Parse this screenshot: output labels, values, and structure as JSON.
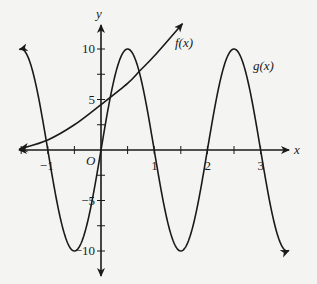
{
  "chart_data": {
    "type": "line",
    "title": "",
    "xlabel": "x",
    "ylabel": "y",
    "origin_label": "O",
    "xlim": [
      -1.55,
      3.55
    ],
    "ylim": [
      -12.3,
      14.5
    ],
    "x_ticks": [
      -1.5,
      -1,
      -0.5,
      0.5,
      1,
      1.5,
      2,
      2.5,
      3
    ],
    "x_tick_labels": [
      {
        "value": -1,
        "label": "−1"
      },
      {
        "value": 1,
        "label": "1"
      },
      {
        "value": 2,
        "label": "2"
      },
      {
        "value": 3,
        "label": "3"
      }
    ],
    "y_ticks": [
      -10,
      -7.5,
      -5,
      -2.5,
      2.5,
      5,
      7.5,
      10
    ],
    "y_tick_labels": [
      {
        "value": 10,
        "label": "10"
      },
      {
        "value": 5,
        "label": "5"
      },
      {
        "value": -5,
        "label": "−5"
      },
      {
        "value": -10,
        "label": "−10"
      }
    ],
    "grid": false,
    "series": [
      {
        "name": "f(x)",
        "label": "f(x)",
        "description": "increasing exponential-like curve",
        "points": [
          [
            -1.53,
            0.1
          ],
          [
            -1.0,
            1.0
          ],
          [
            -0.5,
            2.5
          ],
          [
            0,
            4.5
          ],
          [
            0.5,
            6.6
          ],
          [
            0.74,
            7.9
          ],
          [
            1.0,
            9.3
          ],
          [
            1.53,
            12.5
          ]
        ],
        "arrow_ends": [
          "left",
          "right"
        ]
      },
      {
        "name": "g(x)",
        "label": "g(x)",
        "formula": "10 sin(pi x)",
        "x_range": [
          -1.53,
          3.53
        ],
        "amplitude": 10,
        "period": 2,
        "zeros": [
          -1,
          0,
          1,
          2,
          3
        ],
        "maxima": [
          [
            -1.5,
            10
          ],
          [
            0.5,
            10
          ],
          [
            2.5,
            10
          ]
        ],
        "minima": [
          [
            -0.5,
            -10
          ],
          [
            1.5,
            -10
          ],
          [
            3.5,
            -10
          ]
        ],
        "arrow_ends": [
          "left",
          "right"
        ]
      }
    ]
  },
  "labels": {
    "x_axis": "x",
    "y_axis": "y",
    "origin": "O",
    "f_label": "f(x)",
    "g_label": "g(x)"
  }
}
